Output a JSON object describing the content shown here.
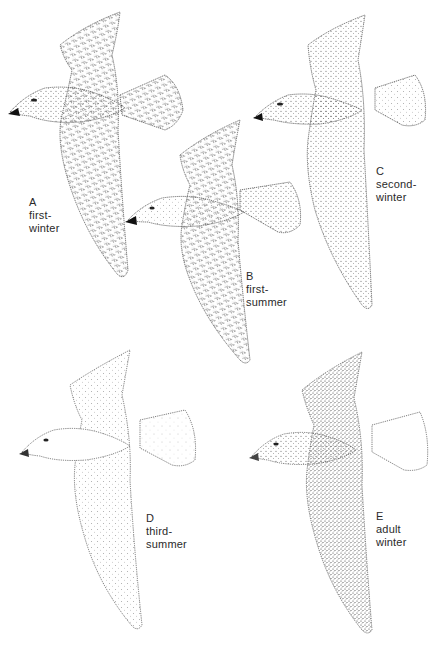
{
  "plate": {
    "subject": "Gulls in flight by age class",
    "colors": {
      "ink": "#2a2a2a",
      "paper": "#ffffff",
      "bill_tip": "#111111"
    }
  },
  "birds": [
    {
      "letter": "A",
      "line1": "first-",
      "line2": "winter"
    },
    {
      "letter": "B",
      "line1": "first-",
      "line2": "summer"
    },
    {
      "letter": "C",
      "line1": "second-",
      "line2": "winter"
    },
    {
      "letter": "D",
      "line1": "third-",
      "line2": "summer"
    },
    {
      "letter": "E",
      "line1": "adult",
      "line2": "winter"
    }
  ]
}
